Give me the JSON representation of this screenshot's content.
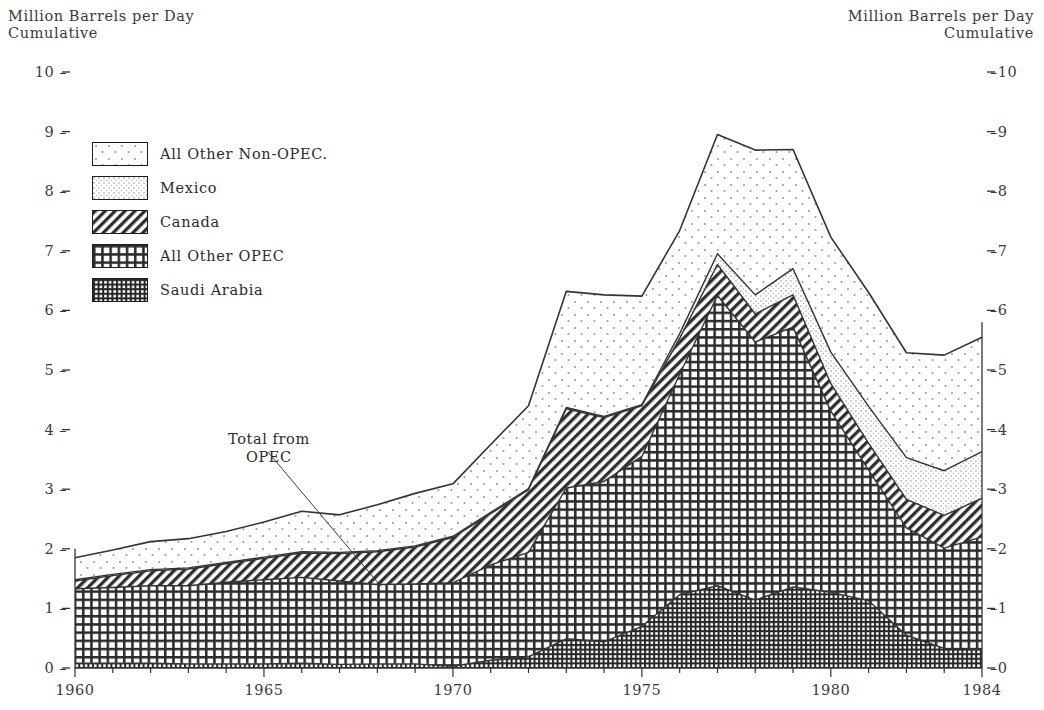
{
  "axis_titles": {
    "left": "Million Barrels per Day\nCumulative",
    "right": "Million Barrels per Day\nCumulative"
  },
  "annotation": {
    "text": "Total from\nOPEC"
  },
  "legend": {
    "items": [
      {
        "label": "All Other Non-OPEC.",
        "pattern": "sparse-dots",
        "key": "all_other_non_opec"
      },
      {
        "label": "Mexico",
        "pattern": "fine-dot-grid",
        "key": "mexico"
      },
      {
        "label": "Canada",
        "pattern": "diagonal-hatch",
        "key": "canada"
      },
      {
        "label": "All Other OPEC",
        "pattern": "crosshatch-grid",
        "key": "all_other_opec"
      },
      {
        "label": "Saudi Arabia",
        "pattern": "dense-crosshatch",
        "key": "saudi_arabia"
      }
    ]
  },
  "chart_data": {
    "type": "area",
    "stacked": true,
    "title": "",
    "xlabel": "",
    "ylabel": "Million Barrels per Day Cumulative",
    "xlim": [
      1960,
      1984
    ],
    "ylim": [
      0,
      10
    ],
    "yticks": [
      0,
      1,
      2,
      3,
      4,
      5,
      6,
      7,
      8,
      9,
      10
    ],
    "ytick_labels": [
      "0",
      "1",
      "2",
      "3",
      "4",
      "5",
      "6",
      "7",
      "8",
      "9",
      "10"
    ],
    "xticks": [
      1960,
      1965,
      1970,
      1975,
      1980,
      1984
    ],
    "xtick_labels": [
      "1960",
      "1965",
      "1970",
      "1975",
      "1980",
      "1984"
    ],
    "grid": false,
    "legend_position": "upper-left-inside",
    "x": [
      1960,
      1961,
      1962,
      1963,
      1964,
      1965,
      1966,
      1967,
      1968,
      1969,
      1970,
      1971,
      1972,
      1973,
      1974,
      1975,
      1976,
      1977,
      1978,
      1979,
      1980,
      1981,
      1982,
      1983,
      1984
    ],
    "series": [
      {
        "name": "Saudi Arabia",
        "pattern": "dense-crosshatch",
        "values": [
          0.08,
          0.08,
          0.08,
          0.07,
          0.07,
          0.07,
          0.08,
          0.06,
          0.07,
          0.07,
          0.03,
          0.13,
          0.19,
          0.49,
          0.44,
          0.7,
          1.23,
          1.38,
          1.14,
          1.36,
          1.27,
          1.13,
          0.55,
          0.33,
          0.32
        ]
      },
      {
        "name": "All Other OPEC",
        "pattern": "crosshatch-grid",
        "values": [
          1.25,
          1.27,
          1.3,
          1.31,
          1.37,
          1.41,
          1.44,
          1.4,
          1.33,
          1.34,
          1.4,
          1.6,
          1.75,
          2.53,
          2.69,
          2.85,
          3.7,
          4.87,
          4.33,
          4.36,
          3.04,
          2.19,
          1.8,
          1.68,
          1.88
        ]
      },
      {
        "name": "Canada",
        "pattern": "diagonal-hatch",
        "values": [
          0.13,
          0.2,
          0.25,
          0.28,
          0.31,
          0.36,
          0.41,
          0.46,
          0.55,
          0.62,
          0.76,
          0.86,
          1.05,
          1.33,
          1.07,
          0.85,
          0.6,
          0.52,
          0.47,
          0.54,
          0.46,
          0.45,
          0.48,
          0.55,
          0.65
        ]
      },
      {
        "name": "Mexico",
        "pattern": "fine-dot-grid",
        "values": [
          0.02,
          0.02,
          0.02,
          0.02,
          0.02,
          0.02,
          0.02,
          0.02,
          0.02,
          0.02,
          0.02,
          0.02,
          0.02,
          0.02,
          0.02,
          0.02,
          0.08,
          0.18,
          0.32,
          0.44,
          0.53,
          0.62,
          0.7,
          0.75,
          0.78
        ]
      },
      {
        "name": "All Other Non-OPEC.",
        "pattern": "sparse-dots",
        "values": [
          0.37,
          0.41,
          0.47,
          0.49,
          0.52,
          0.59,
          0.68,
          0.63,
          0.77,
          0.88,
          0.88,
          1.14,
          1.39,
          1.95,
          2.04,
          1.82,
          1.73,
          2.0,
          2.43,
          2.0,
          1.93,
          1.91,
          1.76,
          1.94,
          1.92
        ]
      }
    ],
    "totals": [
      1.85,
      1.98,
      2.12,
      2.17,
      2.29,
      2.45,
      2.63,
      2.57,
      2.74,
      2.93,
      3.09,
      3.75,
      4.4,
      6.32,
      6.26,
      6.24,
      7.34,
      8.95,
      8.69,
      8.7,
      7.23,
      6.3,
      5.29,
      5.25,
      5.55
    ]
  }
}
